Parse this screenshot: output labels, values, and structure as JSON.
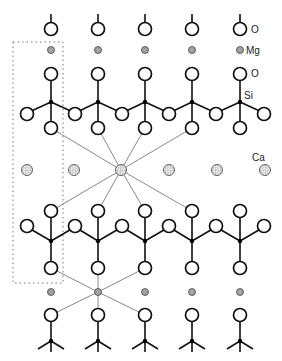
{
  "diagram": {
    "labels": {
      "oxygen_top": "O",
      "magnesium": "Mg",
      "oxygen_apex": "O",
      "silicon": "Si",
      "calcium": "Ca"
    },
    "columns_x": [
      51,
      98,
      145,
      192,
      240
    ],
    "colors": {
      "bond": "#111111",
      "coordination_line": "#888888",
      "oxygen_fill": "#ffffff",
      "magnesium_fill": "#9a9a9a",
      "calcium_fill": "#e4e4e4",
      "unit_cell_border": "#777777"
    },
    "legend": [
      {
        "symbol": "open-circle",
        "label": "O"
      },
      {
        "symbol": "small-hatched-circle",
        "label": "Mg"
      },
      {
        "symbol": "dot",
        "label": "Si"
      },
      {
        "symbol": "dotted-circle",
        "label": "Ca"
      }
    ]
  }
}
